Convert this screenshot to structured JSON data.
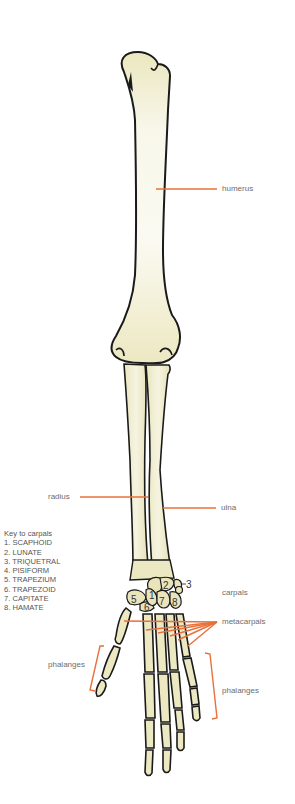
{
  "diagram": {
    "colors": {
      "bone_fill": "#ece8c2",
      "bone_light": "#f7f5e4",
      "outline": "#1a1a1a",
      "leader_line": "#e8703a",
      "label_text": "#6d6d6d"
    },
    "labels": {
      "humerus": "humerus",
      "radius": "radius",
      "ulna": "ulna",
      "carpals": "carpals",
      "metacarpals": "metacarpals",
      "phalanges_thumb": "phalanges",
      "phalanges_fingers": "phalanges"
    },
    "key": {
      "title": "Key to carpals",
      "items": [
        "1. SCAPHOID",
        "2. LUNATE",
        "3. TRIQUETRAL",
        "4. PISIFORM",
        "5. TRAPEZIUM",
        "6. TRAPEZOID",
        "7. CAPITATE",
        "8. HAMATE"
      ]
    },
    "carpal_numbers": [
      "1",
      "2",
      "3",
      "4",
      "5",
      "6",
      "7",
      "8"
    ]
  }
}
